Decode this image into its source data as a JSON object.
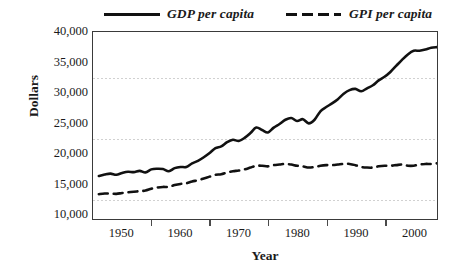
{
  "chart_data": {
    "type": "line",
    "title": "",
    "xlabel": "Year",
    "ylabel": "Dollars",
    "xlim": [
      1945,
      2004
    ],
    "ylim": [
      9100,
      40000
    ],
    "grid": "horizontal-dotted-minor",
    "legend_position": "top",
    "y_ticks": [
      40000,
      35000,
      30000,
      25000,
      20000,
      15000,
      10000
    ],
    "y_ticklabels": [
      "40,000",
      "35,000",
      "30,000",
      "25,000",
      "20,000",
      "15,000",
      "10,000"
    ],
    "gridline_values": [
      32500,
      22500,
      12500
    ],
    "x_ticklabels": [
      "1950",
      "1960",
      "1970",
      "1980",
      "1990",
      "2000"
    ],
    "x_tickvalues": [
      1950,
      1960,
      1970,
      1980,
      1990,
      2000
    ],
    "x_tickmark_values": [
      1955,
      1965,
      1975,
      1985,
      1995
    ],
    "x": [
      1946,
      1947,
      1948,
      1949,
      1950,
      1951,
      1952,
      1953,
      1954,
      1955,
      1956,
      1957,
      1958,
      1959,
      1960,
      1961,
      1962,
      1963,
      1964,
      1965,
      1966,
      1967,
      1968,
      1969,
      1970,
      1971,
      1972,
      1973,
      1974,
      1975,
      1976,
      1977,
      1978,
      1979,
      1980,
      1981,
      1982,
      1983,
      1984,
      1985,
      1986,
      1987,
      1988,
      1989,
      1990,
      1991,
      1992,
      1993,
      1994,
      1995,
      1996,
      1997,
      1998,
      1999,
      2000,
      2001,
      2002,
      2003,
      2004
    ],
    "series": [
      {
        "name": "GDP per capita",
        "style": "solid",
        "color": "#111111",
        "values": [
          16200,
          16450,
          16600,
          16400,
          16700,
          16900,
          16850,
          17050,
          16800,
          17300,
          17400,
          17350,
          17000,
          17500,
          17700,
          17700,
          18300,
          18700,
          19300,
          20000,
          20800,
          21100,
          21800,
          22200,
          22000,
          22500,
          23300,
          24200,
          23800,
          23400,
          24200,
          24800,
          25500,
          25800,
          25300,
          25600,
          24900,
          25500,
          26900,
          27600,
          28200,
          28900,
          29800,
          30400,
          30600,
          30200,
          30700,
          31200,
          32000,
          32600,
          33400,
          34400,
          35400,
          36300,
          36900,
          36900,
          37100,
          37400,
          37500
        ]
      },
      {
        "name": "GPI per capita",
        "style": "dashed",
        "color": "#111111",
        "values": [
          13200,
          13300,
          13300,
          13250,
          13400,
          13500,
          13600,
          13700,
          13800,
          14100,
          14300,
          14400,
          14400,
          14700,
          14900,
          15000,
          15300,
          15500,
          15800,
          16100,
          16400,
          16500,
          16800,
          17000,
          17100,
          17300,
          17600,
          17900,
          17900,
          17800,
          18000,
          18100,
          18200,
          18100,
          17900,
          17800,
          17600,
          17700,
          17900,
          18000,
          18000,
          18100,
          18200,
          18200,
          18000,
          17700,
          17600,
          17600,
          17800,
          17900,
          17900,
          18000,
          18100,
          17900,
          17900,
          18100,
          18200,
          18200,
          18300
        ]
      }
    ]
  },
  "legend": {
    "entries": [
      {
        "label": "GDP per capita"
      },
      {
        "label": "GPI per capita"
      }
    ]
  }
}
